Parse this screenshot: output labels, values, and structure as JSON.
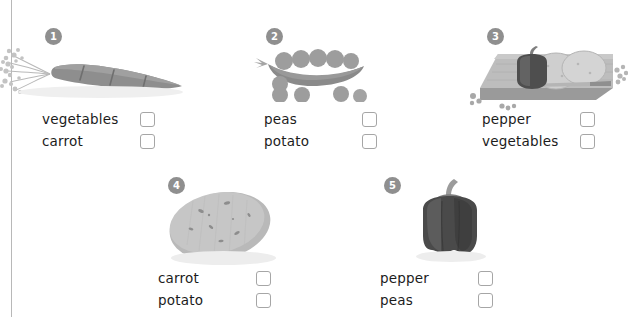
{
  "page": {
    "type": "vocabulary-matching-worksheet",
    "background_color": "#ffffff",
    "margin_rule_color": "#b8b8b8",
    "badge_color": "#8f8f8f",
    "badge_text_color": "#ffffff",
    "checkbox_border_color": "#a6a6a6",
    "label_color": "#1c1c1c"
  },
  "items": [
    {
      "number": "1",
      "picture": "carrot-illustration",
      "options": [
        {
          "label": "vegetables",
          "checked": false
        },
        {
          "label": "carrot",
          "checked": false
        }
      ]
    },
    {
      "number": "2",
      "picture": "pea-pod-illustration",
      "options": [
        {
          "label": "peas",
          "checked": false
        },
        {
          "label": "potato",
          "checked": false
        }
      ]
    },
    {
      "number": "3",
      "picture": "cutting-board-with-pepper-and-potato-slices-illustration",
      "options": [
        {
          "label": "pepper",
          "checked": false
        },
        {
          "label": "vegetables",
          "checked": false
        }
      ]
    },
    {
      "number": "4",
      "picture": "potato-illustration",
      "options": [
        {
          "label": "carrot",
          "checked": false
        },
        {
          "label": "potato",
          "checked": false
        }
      ]
    },
    {
      "number": "5",
      "picture": "bell-pepper-illustration",
      "options": [
        {
          "label": "pepper",
          "checked": false
        },
        {
          "label": "peas",
          "checked": false
        }
      ]
    }
  ]
}
